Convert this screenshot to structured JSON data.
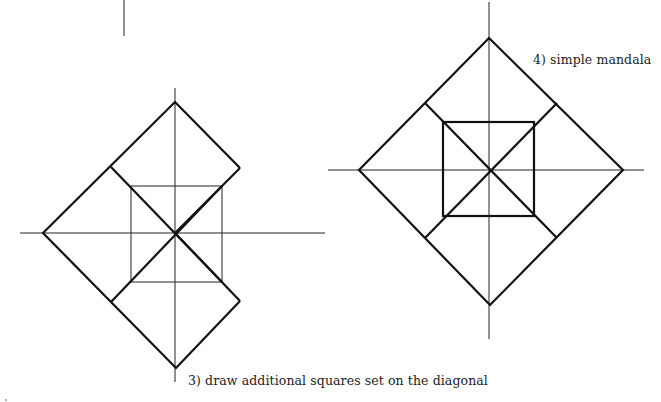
{
  "captions": {
    "step3": "3)  draw additional squares set on the diagonal",
    "step4": "4)  simple mandala"
  },
  "figures": [
    {
      "id": "step3-figure",
      "description": "Partial mandala: outer diamond with additional squares set on the diagonal (right-side squares only)",
      "center": [
        175,
        233
      ]
    },
    {
      "id": "step4-figure",
      "description": "Simple mandala: outer diamond, inner square, diagonals and corner squares",
      "center": [
        490,
        170
      ]
    }
  ],
  "colors": {
    "line": "#111111",
    "background": "#ffffff"
  }
}
